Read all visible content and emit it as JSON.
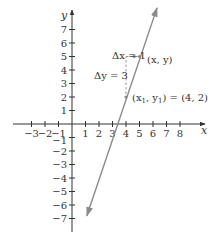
{
  "chart_data": {
    "type": "line",
    "title": "",
    "xlabel": "x",
    "ylabel": "y",
    "xlim": [
      -3.5,
      9.5
    ],
    "ylim": [
      -8,
      8
    ],
    "x_ticks": [
      -3,
      -2,
      -1,
      1,
      2,
      3,
      4,
      5,
      6,
      7,
      8
    ],
    "y_ticks": [
      -7,
      -6,
      -5,
      -4,
      -3,
      -2,
      -1,
      1,
      2,
      3,
      4,
      5,
      6,
      7
    ],
    "x_tick_labels": [
      "−3",
      "−2",
      "−1",
      "1",
      "2",
      "3",
      "4",
      "5",
      "6",
      "7",
      "8"
    ],
    "y_tick_labels": [
      "−7",
      "−6",
      "−5",
      "−4",
      "−3",
      "−2",
      "−1",
      "1",
      "2",
      "3",
      "4",
      "5",
      "6",
      "7"
    ],
    "grid": false,
    "series": [
      {
        "name": "line y = 3x − 10",
        "x": [
          1.1,
          6.3
        ],
        "y": [
          -6.8,
          8.6
        ],
        "slope": 3,
        "color": "#8a8a8a",
        "arrows": "both"
      }
    ],
    "points": [
      {
        "label": "(x1, y1) = (4, 2)",
        "x": 4,
        "y": 2
      },
      {
        "label": "(x, y)",
        "x": 5,
        "y": 5
      }
    ],
    "annotations": [
      {
        "text": "Δx = 1",
        "kind": "horizontal-run",
        "from": [
          4,
          5
        ],
        "to": [
          5,
          5
        ]
      },
      {
        "text": "Δy = 3",
        "kind": "vertical-rise",
        "from": [
          4,
          2
        ],
        "to": [
          4,
          5
        ]
      }
    ]
  },
  "labels": {
    "x_axis": "x",
    "y_axis": "y",
    "delta_x": "Δx = 1",
    "delta_y": "Δy = 3",
    "point_xy": "(x, y)",
    "point_x1y1_prefix": "(x",
    "point_x1y1_mid": ", y",
    "point_x1y1_suffix": ") = (4, 2)",
    "sub_1": "1"
  },
  "colors": {
    "axis": "#333333",
    "line": "#8a8a8a",
    "dashed": "#8a8a8a"
  }
}
